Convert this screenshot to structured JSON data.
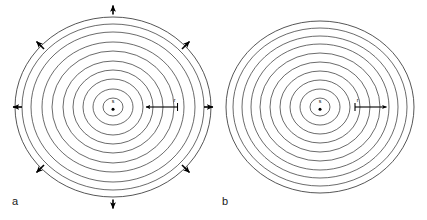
{
  "figure": {
    "width": 427,
    "height": 220,
    "background_color": "#ffffff",
    "stroke_color": "#2b2b2b",
    "arrow_color": "#000000",
    "panels": [
      {
        "id": "a",
        "label": "a",
        "center": {
          "x": 113,
          "y": 107
        },
        "source_label": "s",
        "radius_label": "r",
        "radius_arrow_direction": "inward-left",
        "ring_count": 10,
        "ring_radii_x": [
          10,
          20,
          30,
          40,
          50,
          61,
          71,
          82,
          91,
          98
        ],
        "ring_radii_y": [
          9,
          18,
          28,
          37,
          46,
          56,
          65,
          75,
          83,
          90
        ],
        "has_radial_arrows": true,
        "radial_arrow_count": 8,
        "radial_arrows": [
          {
            "name": "arrow-north",
            "angle_deg": 270
          },
          {
            "name": "arrow-northeast",
            "angle_deg": 315
          },
          {
            "name": "arrow-east",
            "angle_deg": 0
          },
          {
            "name": "arrow-southeast",
            "angle_deg": 45
          },
          {
            "name": "arrow-south",
            "angle_deg": 90
          },
          {
            "name": "arrow-southwest",
            "angle_deg": 135
          },
          {
            "name": "arrow-west",
            "angle_deg": 180
          },
          {
            "name": "arrow-northwest",
            "angle_deg": 225
          }
        ]
      },
      {
        "id": "b",
        "label": "b",
        "center": {
          "x": 320,
          "y": 107
        },
        "source_label": "s",
        "radius_label": "r",
        "radius_arrow_direction": "outward-right",
        "ring_count": 10,
        "ring_radii_x": [
          10,
          20,
          30,
          40,
          50,
          60,
          69,
          78,
          87,
          94
        ],
        "ring_radii_y": [
          9,
          18,
          27,
          36,
          45,
          54,
          63,
          71,
          79,
          86
        ],
        "has_radial_arrows": false,
        "radial_arrow_count": 0,
        "radial_arrows": []
      }
    ]
  }
}
